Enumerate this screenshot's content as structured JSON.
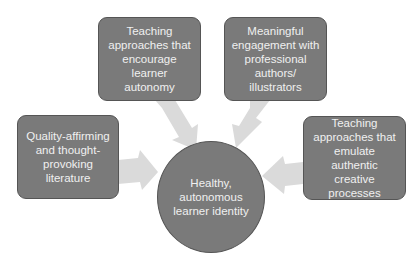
{
  "diagram": {
    "center": {
      "label": "Healthy, autonomous learner identity"
    },
    "nodes": [
      {
        "id": "top-left",
        "label": "Teaching approaches that encourage learner autonomy"
      },
      {
        "id": "top-right",
        "label": "Meaningful engagement with professional authors/ illustrators"
      },
      {
        "id": "left",
        "label": "Quality-affirming and thought-provoking literature"
      },
      {
        "id": "right",
        "label": "Teaching approaches that emulate authentic creative processes"
      }
    ],
    "colors": {
      "node_fill": "#7a7a7a",
      "node_border": "#555555",
      "text": "#f0f0f0",
      "arrow": "#d9d9d9"
    }
  }
}
